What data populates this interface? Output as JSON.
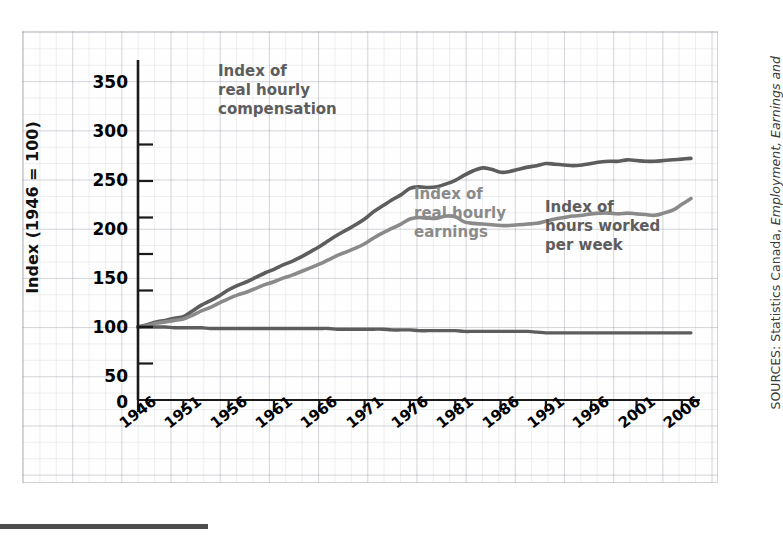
{
  "chart_data": {
    "type": "line",
    "title": "",
    "xlabel": "",
    "ylabel": "Index (1946 = 100)",
    "ylim": [
      0,
      375
    ],
    "yticks": [
      0,
      50,
      100,
      150,
      200,
      250,
      300,
      350
    ],
    "xlim": [
      1946,
      2008
    ],
    "xticks": [
      1946,
      1951,
      1956,
      1961,
      1966,
      1971,
      1976,
      1981,
      1986,
      1991,
      1996,
      2001,
      2006
    ],
    "grid": true,
    "legend_position": "in-plot annotations",
    "series": [
      {
        "name": "Index of real hourly compensation",
        "color": "#5d5d5d",
        "x": [
          1946,
          1947,
          1948,
          1949,
          1950,
          1951,
          1952,
          1953,
          1954,
          1955,
          1956,
          1957,
          1958,
          1959,
          1960,
          1961,
          1962,
          1963,
          1964,
          1965,
          1966,
          1967,
          1968,
          1969,
          1970,
          1971,
          1972,
          1973,
          1974,
          1975,
          1976,
          1977,
          1978,
          1979,
          1980,
          1981,
          1982,
          1983,
          1984,
          1985,
          1986,
          1987,
          1988,
          1989,
          1990,
          1991,
          1992,
          1993,
          1994,
          1995,
          1996,
          1997,
          1998,
          1999,
          2000,
          2001,
          2002,
          2003,
          2004,
          2005,
          2006,
          2007
        ],
        "values": [
          100,
          103,
          107,
          109,
          112,
          114,
          122,
          130,
          136,
          143,
          151,
          157,
          162,
          168,
          174,
          179,
          185,
          190,
          196,
          203,
          210,
          218,
          226,
          233,
          240,
          248,
          258,
          266,
          274,
          281,
          290,
          292,
          291,
          292,
          296,
          301,
          308,
          314,
          318,
          316,
          312,
          313,
          316,
          319,
          321,
          324,
          323,
          322,
          321,
          322,
          324,
          326,
          327,
          327,
          329,
          328,
          327,
          327,
          328,
          329,
          330,
          331
        ]
      },
      {
        "name": "Index of real hourly earnings",
        "color": "#8a8a8a",
        "x": [
          1946,
          1947,
          1948,
          1949,
          1950,
          1951,
          1952,
          1953,
          1954,
          1955,
          1956,
          1957,
          1958,
          1959,
          1960,
          1961,
          1962,
          1963,
          1964,
          1965,
          1966,
          1967,
          1968,
          1969,
          1970,
          1971,
          1972,
          1973,
          1974,
          1975,
          1976,
          1977,
          1978,
          1979,
          1980,
          1981,
          1982,
          1983,
          1984,
          1985,
          1986,
          1987,
          1988,
          1989,
          1990,
          1991,
          1992,
          1993,
          1994,
          1995,
          1996,
          1997,
          1998,
          1999,
          2000,
          2001,
          2002,
          2003,
          2004,
          2005,
          2006,
          2007
        ],
        "values": [
          100,
          102,
          105,
          107,
          109,
          111,
          116,
          122,
          127,
          133,
          139,
          144,
          148,
          153,
          158,
          162,
          167,
          171,
          176,
          181,
          186,
          192,
          198,
          203,
          208,
          214,
          222,
          229,
          235,
          241,
          248,
          250,
          249,
          249,
          252,
          251,
          244,
          242,
          241,
          240,
          239,
          239,
          240,
          241,
          242,
          245,
          248,
          250,
          252,
          253,
          255,
          256,
          256,
          255,
          256,
          255,
          254,
          253,
          256,
          260,
          268,
          276
        ]
      },
      {
        "name": "Index of hours worked per week",
        "color": "#5d5d5d",
        "x": [
          1946,
          1947,
          1948,
          1949,
          1950,
          1951,
          1952,
          1953,
          1954,
          1955,
          1956,
          1957,
          1958,
          1959,
          1960,
          1961,
          1962,
          1963,
          1964,
          1965,
          1966,
          1967,
          1968,
          1969,
          1970,
          1971,
          1972,
          1973,
          1974,
          1975,
          1976,
          1977,
          1978,
          1979,
          1980,
          1981,
          1982,
          1983,
          1984,
          1985,
          1986,
          1987,
          1988,
          1989,
          1990,
          1991,
          1992,
          1993,
          1994,
          1995,
          1996,
          1997,
          1998,
          1999,
          2000,
          2001,
          2002,
          2003,
          2004,
          2005,
          2006,
          2007
        ],
        "values": [
          100,
          100,
          100,
          100,
          99,
          99,
          99,
          99,
          98,
          98,
          98,
          98,
          98,
          98,
          98,
          98,
          98,
          98,
          98,
          98,
          98,
          98,
          97,
          97,
          97,
          97,
          97,
          97,
          96,
          96,
          96,
          95,
          95,
          95,
          95,
          95,
          94,
          94,
          94,
          94,
          94,
          94,
          94,
          94,
          93,
          92,
          92,
          92,
          92,
          92,
          92,
          92,
          92,
          92,
          92,
          92,
          92,
          92,
          92,
          92,
          92,
          92
        ]
      }
    ],
    "annotations": [
      {
        "text": "Index of\nreal hourly\ncompensation",
        "series": "Index of real hourly compensation"
      },
      {
        "text": "Index of\nreal hourly\nearnings",
        "series": "Index of real hourly earnings"
      },
      {
        "text": "Index of\nhours worked\nper week",
        "series": "Index of hours worked per week"
      }
    ]
  },
  "axis": {
    "y_title": "Index (1946 = 100)",
    "y_tick_labels": [
      "350",
      "300",
      "250",
      "200",
      "150",
      "100",
      "50",
      "0"
    ],
    "x_tick_labels": [
      "1946",
      "1951",
      "1956",
      "1961",
      "1966",
      "1971",
      "1976",
      "1981",
      "1986",
      "1991",
      "1996",
      "2001",
      "2006"
    ]
  },
  "annotations": {
    "compensation": "Index of\nreal hourly\ncompensation",
    "earnings": "Index of\nreal hourly\nearnings",
    "hours": "Index of\nhours worked\nper week"
  },
  "source": {
    "prefix": "SOURCES: Statistics Canada, ",
    "italic": "Employment, Earnings and"
  },
  "colors": {
    "series_dark": "#5d5d5d",
    "series_mid": "#8a8a8a",
    "axis": "#1a1a1a",
    "grid": "#9aa0aa",
    "paper": "#fefefe"
  }
}
